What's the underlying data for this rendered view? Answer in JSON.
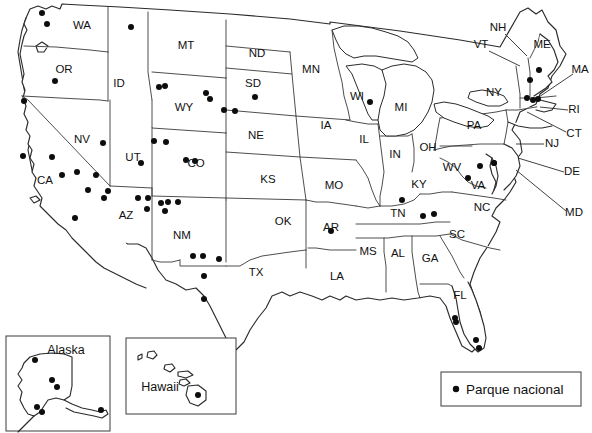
{
  "map": {
    "title": "Mapa de parques nacionales de Estados Unidos",
    "legend": {
      "symbol": "filled-circle",
      "label": "Parque nacional",
      "color": "#0d0d0d"
    },
    "insets": [
      {
        "name": "alaska",
        "label": "Alaska"
      },
      {
        "name": "hawaii",
        "label": "Hawaii"
      }
    ],
    "state_labels": [
      {
        "code": "WA",
        "name": "Washington",
        "x": 82,
        "y": 26
      },
      {
        "code": "OR",
        "name": "Oregon",
        "x": 64,
        "y": 70
      },
      {
        "code": "ID",
        "name": "Idaho",
        "x": 119,
        "y": 84
      },
      {
        "code": "MT",
        "name": "Montana",
        "x": 186,
        "y": 46
      },
      {
        "code": "ND",
        "name": "North Dakota",
        "x": 257,
        "y": 54
      },
      {
        "code": "SD",
        "name": "South Dakota",
        "x": 253,
        "y": 84
      },
      {
        "code": "WY",
        "name": "Wyoming",
        "x": 184,
        "y": 108
      },
      {
        "code": "NE",
        "name": "Nebraska",
        "x": 256,
        "y": 136
      },
      {
        "code": "NV",
        "name": "Nevada",
        "x": 82,
        "y": 140
      },
      {
        "code": "UT",
        "name": "Utah",
        "x": 133,
        "y": 158
      },
      {
        "code": "CO",
        "name": "Colorado",
        "x": 196,
        "y": 164
      },
      {
        "code": "KS",
        "name": "Kansas",
        "x": 268,
        "y": 180
      },
      {
        "code": "CA",
        "name": "California",
        "x": 45,
        "y": 181
      },
      {
        "code": "AZ",
        "name": "Arizona",
        "x": 126,
        "y": 216
      },
      {
        "code": "NM",
        "name": "New Mexico",
        "x": 182,
        "y": 236
      },
      {
        "code": "OK",
        "name": "Oklahoma",
        "x": 283,
        "y": 222
      },
      {
        "code": "TX",
        "name": "Texas",
        "x": 256,
        "y": 273
      },
      {
        "code": "MN",
        "name": "Minnesota",
        "x": 311,
        "y": 70
      },
      {
        "code": "IA",
        "name": "Iowa",
        "x": 326,
        "y": 126
      },
      {
        "code": "MO",
        "name": "Missouri",
        "x": 334,
        "y": 186
      },
      {
        "code": "AR",
        "name": "Arkansas",
        "x": 331,
        "y": 228
      },
      {
        "code": "LA",
        "name": "Louisiana",
        "x": 337,
        "y": 277
      },
      {
        "code": "WI",
        "name": "Wisconsin",
        "x": 357,
        "y": 97
      },
      {
        "code": "IL",
        "name": "Illinois",
        "x": 364,
        "y": 140
      },
      {
        "code": "MI",
        "name": "Michigan",
        "x": 401,
        "y": 108
      },
      {
        "code": "IN",
        "name": "Indiana",
        "x": 395,
        "y": 155
      },
      {
        "code": "OH",
        "name": "Ohio",
        "x": 428,
        "y": 148
      },
      {
        "code": "KY",
        "name": "Kentucky",
        "x": 419,
        "y": 185
      },
      {
        "code": "TN",
        "name": "Tennessee",
        "x": 398,
        "y": 214
      },
      {
        "code": "MS",
        "name": "Mississippi",
        "x": 368,
        "y": 252
      },
      {
        "code": "AL",
        "name": "Alabama",
        "x": 398,
        "y": 254
      },
      {
        "code": "GA",
        "name": "Georgia",
        "x": 430,
        "y": 259
      },
      {
        "code": "FL",
        "name": "Florida",
        "x": 460,
        "y": 296
      },
      {
        "code": "SC",
        "name": "South Carolina",
        "x": 457,
        "y": 235
      },
      {
        "code": "NC",
        "name": "North Carolina",
        "x": 482,
        "y": 208
      },
      {
        "code": "VA",
        "name": "Virginia",
        "x": 478,
        "y": 186
      },
      {
        "code": "WV",
        "name": "West Virginia",
        "x": 452,
        "y": 168
      },
      {
        "code": "PA",
        "name": "Pennsylvania",
        "x": 474,
        "y": 126
      },
      {
        "code": "NY",
        "name": "New York",
        "x": 494,
        "y": 93
      }
    ],
    "callout_labels": [
      {
        "code": "NH",
        "name": "New Hampshire",
        "x": 498,
        "y": 28,
        "line": [
          [
            505,
            34
          ],
          [
            527,
            56
          ]
        ]
      },
      {
        "code": "VT",
        "name": "Vermont",
        "x": 481,
        "y": 45,
        "line": [
          [
            489,
            51
          ],
          [
            520,
            66
          ]
        ]
      },
      {
        "code": "ME",
        "name": "Maine",
        "x": 542,
        "y": 45
      },
      {
        "code": "MA",
        "name": "Massachusetts",
        "x": 580,
        "y": 70,
        "line": [
          [
            573,
            74
          ],
          [
            536,
            99
          ]
        ]
      },
      {
        "code": "RI",
        "name": "Rhode Island",
        "x": 574,
        "y": 110,
        "line": [
          [
            568,
            110
          ],
          [
            540,
            107
          ]
        ]
      },
      {
        "code": "CT",
        "name": "Connecticut",
        "x": 574,
        "y": 134,
        "line": [
          [
            566,
            132
          ],
          [
            527,
            112
          ]
        ]
      },
      {
        "code": "NJ",
        "name": "New Jersey",
        "x": 552,
        "y": 144,
        "line": [
          [
            544,
            144
          ],
          [
            516,
            144
          ]
        ]
      },
      {
        "code": "DE",
        "name": "Delaware",
        "x": 572,
        "y": 172,
        "line": [
          [
            564,
            172
          ],
          [
            518,
            158
          ]
        ]
      },
      {
        "code": "MD",
        "name": "Maryland",
        "x": 574,
        "y": 213,
        "line": [
          [
            566,
            211
          ],
          [
            516,
            170
          ]
        ]
      }
    ],
    "park_dots": [
      {
        "x": 42,
        "y": 13,
        "state": "WA"
      },
      {
        "x": 47,
        "y": 24,
        "state": "WA"
      },
      {
        "x": 131,
        "y": 27,
        "state": "MT"
      },
      {
        "x": 55,
        "y": 81,
        "state": "OR"
      },
      {
        "x": 159,
        "y": 87,
        "state": "WY"
      },
      {
        "x": 165,
        "y": 86,
        "state": "WY"
      },
      {
        "x": 206,
        "y": 93,
        "state": "WY"
      },
      {
        "x": 210,
        "y": 99,
        "state": "WY"
      },
      {
        "x": 24,
        "y": 101,
        "state": "CA"
      },
      {
        "x": 255,
        "y": 97,
        "state": "SD"
      },
      {
        "x": 224,
        "y": 110,
        "state": "SD"
      },
      {
        "x": 235,
        "y": 111,
        "state": "SD"
      },
      {
        "x": 103,
        "y": 143,
        "state": "NV"
      },
      {
        "x": 154,
        "y": 141,
        "state": "UT"
      },
      {
        "x": 166,
        "y": 142,
        "state": "UT"
      },
      {
        "x": 23,
        "y": 156,
        "state": "CA"
      },
      {
        "x": 52,
        "y": 157,
        "state": "CA"
      },
      {
        "x": 141,
        "y": 163,
        "state": "UT"
      },
      {
        "x": 186,
        "y": 160,
        "state": "CO"
      },
      {
        "x": 195,
        "y": 161,
        "state": "CO"
      },
      {
        "x": 62,
        "y": 175,
        "state": "CA"
      },
      {
        "x": 77,
        "y": 172,
        "state": "CA"
      },
      {
        "x": 96,
        "y": 175,
        "state": "CA"
      },
      {
        "x": 88,
        "y": 190,
        "state": "CA"
      },
      {
        "x": 108,
        "y": 191,
        "state": "AZ"
      },
      {
        "x": 104,
        "y": 198,
        "state": "AZ"
      },
      {
        "x": 138,
        "y": 198,
        "state": "AZ"
      },
      {
        "x": 148,
        "y": 198,
        "state": "AZ"
      },
      {
        "x": 161,
        "y": 203,
        "state": "NM"
      },
      {
        "x": 168,
        "y": 202,
        "state": "NM"
      },
      {
        "x": 178,
        "y": 202,
        "state": "NM"
      },
      {
        "x": 147,
        "y": 209,
        "state": "AZ"
      },
      {
        "x": 165,
        "y": 211,
        "state": "NM"
      },
      {
        "x": 75,
        "y": 218,
        "state": "CA"
      },
      {
        "x": 193,
        "y": 256,
        "state": "NM"
      },
      {
        "x": 203,
        "y": 256,
        "state": "NM"
      },
      {
        "x": 219,
        "y": 259,
        "state": "NM"
      },
      {
        "x": 204,
        "y": 276,
        "state": "TX"
      },
      {
        "x": 204,
        "y": 299,
        "state": "TX"
      },
      {
        "x": 370,
        "y": 102,
        "state": "WI"
      },
      {
        "x": 331,
        "y": 231,
        "state": "AR"
      },
      {
        "x": 402,
        "y": 200,
        "state": "TN"
      },
      {
        "x": 423,
        "y": 216,
        "state": "TN"
      },
      {
        "x": 434,
        "y": 214,
        "state": "TN"
      },
      {
        "x": 480,
        "y": 166,
        "state": "VA"
      },
      {
        "x": 468,
        "y": 178,
        "state": "VA"
      },
      {
        "x": 494,
        "y": 163,
        "state": "MD"
      },
      {
        "x": 530,
        "y": 80,
        "state": "ME"
      },
      {
        "x": 539,
        "y": 70,
        "state": "ME"
      },
      {
        "x": 527,
        "y": 98,
        "state": "MA"
      },
      {
        "x": 533,
        "y": 100,
        "state": "MA"
      },
      {
        "x": 538,
        "y": 99,
        "state": "MA"
      },
      {
        "x": 455,
        "y": 318,
        "state": "FL"
      },
      {
        "x": 456,
        "y": 322,
        "state": "FL"
      },
      {
        "x": 476,
        "y": 340,
        "state": "FL"
      },
      {
        "x": 479,
        "y": 348,
        "state": "FL"
      }
    ],
    "alaska_dots": [
      {
        "x": 35,
        "y": 360
      },
      {
        "x": 52,
        "y": 380
      },
      {
        "x": 57,
        "y": 387
      },
      {
        "x": 37,
        "y": 407
      },
      {
        "x": 42,
        "y": 412
      },
      {
        "x": 101,
        "y": 410
      }
    ],
    "hawaii_dots": [
      {
        "x": 198,
        "y": 395
      }
    ]
  }
}
